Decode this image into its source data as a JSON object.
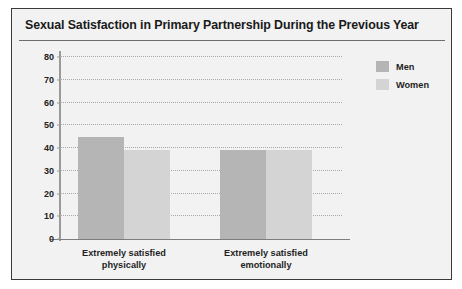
{
  "chart_data": {
    "type": "bar",
    "title": "Sexual Satisfaction in Primary Partnership During the Previous Year",
    "xlabel": "",
    "ylabel": "",
    "ylim": [
      0,
      80
    ],
    "ytick_step": 10,
    "yticks": [
      "80",
      "70",
      "60",
      "50",
      "40",
      "30",
      "20",
      "10",
      "0"
    ],
    "grid": true,
    "legend_position": "top-right",
    "categories": [
      "Extremely satisfied physically",
      "Extremely satisfied emotionally"
    ],
    "category_lines": [
      [
        "Extremely satisfied",
        "physically"
      ],
      [
        "Extremely satisfied",
        "emotionally"
      ]
    ],
    "series": [
      {
        "name": "Men",
        "color": "#b5b5b5",
        "values": [
          45,
          39
        ]
      },
      {
        "name": "Women",
        "color": "#d4d4d4",
        "values": [
          39,
          39
        ]
      }
    ]
  },
  "legend": {
    "items": [
      {
        "label": "Men",
        "color": "#b5b5b5"
      },
      {
        "label": "Women",
        "color": "#d4d4d4"
      }
    ]
  },
  "colors": {
    "frame_border": "#3a3a3a",
    "background": "#f2f2f2",
    "title_rule": "#6e6e6e",
    "gridline": "#a9a9a9",
    "axis": "#9a9a9a",
    "text": "#1a1a1a",
    "men_bar": "#b5b5b5",
    "women_bar": "#d4d4d4"
  }
}
